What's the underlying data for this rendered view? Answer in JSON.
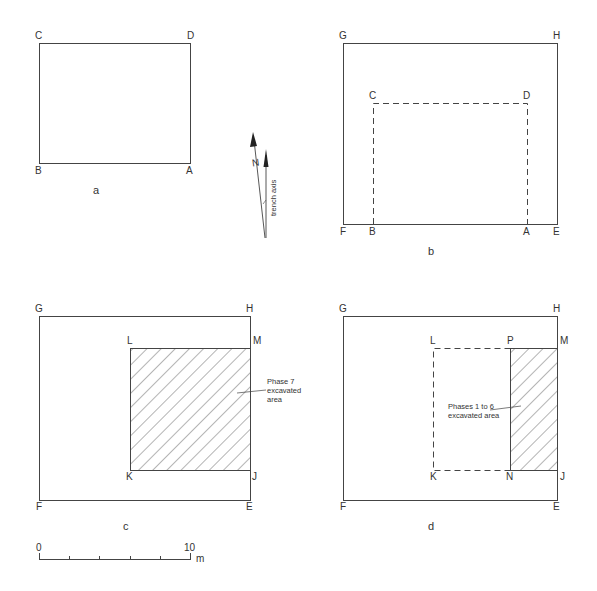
{
  "colors": {
    "line": "#444444",
    "background": "#ffffff"
  },
  "panel_a": {
    "caption": "a",
    "labels": {
      "C": "C",
      "D": "D",
      "B": "B",
      "A": "A"
    }
  },
  "north_arrow": {
    "north_label": "N",
    "trench_label": "trench axis"
  },
  "panel_b": {
    "caption": "b",
    "labels": {
      "G": "G",
      "H": "H",
      "C": "C",
      "D": "D",
      "F": "F",
      "B": "B",
      "A": "A",
      "E": "E"
    }
  },
  "panel_c": {
    "caption": "c",
    "labels": {
      "G": "G",
      "H": "H",
      "L": "L",
      "M": "M",
      "K": "K",
      "J": "J",
      "F": "F",
      "E": "E"
    },
    "note": [
      "Phase 7",
      "excavated",
      "area"
    ]
  },
  "panel_d": {
    "caption": "d",
    "labels": {
      "G": "G",
      "H": "H",
      "L": "L",
      "P": "P",
      "M": "M",
      "K": "K",
      "N": "N",
      "J": "J",
      "F": "F",
      "E": "E"
    },
    "note": [
      "Phases 1 to 6",
      "excavated area"
    ]
  },
  "scale_bar": {
    "start": "0",
    "end": "10",
    "unit": "m"
  }
}
